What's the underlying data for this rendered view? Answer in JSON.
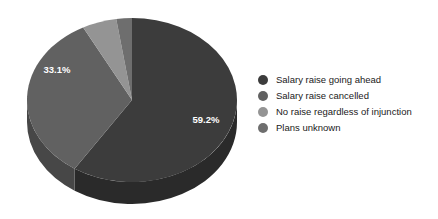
{
  "chart_data": {
    "type": "pie",
    "title": "",
    "subtitle": "",
    "xlabel": "",
    "ylabel": "",
    "legend_position": "right",
    "three_d": true,
    "grid": false,
    "categories": [
      "Salary raise going ahead",
      "Salary raise cancelled",
      "No raise regardless of injunction",
      "Plans unknown"
    ],
    "values": [
      59.2,
      33.1,
      5.3,
      2.4
    ],
    "labels_shown": [
      "59.2%",
      "33.1%",
      "",
      ""
    ],
    "colors": [
      "#3c3c3c",
      "#616161",
      "#949494",
      "#6e6e6e"
    ],
    "slices": [
      {
        "name": "Salary raise going ahead",
        "value": 59.2,
        "label": "59.2%",
        "color": "#3c3c3c",
        "side_color": "#2a2a2a",
        "label_visible": true
      },
      {
        "name": "Salary raise cancelled",
        "value": 33.1,
        "label": "33.1%",
        "color": "#616161",
        "side_color": "#474747",
        "label_visible": true
      },
      {
        "name": "No raise regardless of injunction",
        "value": 5.3,
        "label": "5.3%",
        "color": "#949494",
        "side_color": "#6d6d6d",
        "label_visible": false
      },
      {
        "name": "Plans unknown",
        "value": 2.4,
        "label": "2.4%",
        "color": "#6e6e6e",
        "side_color": "#515151",
        "label_visible": false
      }
    ]
  },
  "pie": {
    "label_main": "59.2%",
    "label_secondary": "33.1%"
  },
  "legend": {
    "items": [
      {
        "label": "Salary raise going ahead",
        "color": "#3c3c3c"
      },
      {
        "label": "Salary raise cancelled",
        "color": "#616161"
      },
      {
        "label": "No raise regardless of injunction",
        "color": "#949494"
      },
      {
        "label": "Plans unknown",
        "color": "#6e6e6e"
      }
    ]
  },
  "canvas": {
    "background": "#ffffff"
  }
}
